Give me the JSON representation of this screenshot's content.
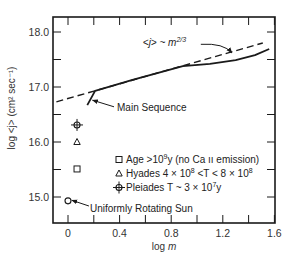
{
  "chart_data": {
    "type": "line",
    "title": "",
    "xlabel": "log m",
    "ylabel": "log <j> (cm² sec⁻¹)",
    "xlim": [
      -0.12,
      1.61
    ],
    "ylim": [
      14.53,
      18.27
    ],
    "grid": false,
    "x_ticks": [
      0,
      0.4,
      0.8,
      1.2,
      1.6
    ],
    "x_tick_labels": [
      "0",
      "0.4",
      "0.8",
      "1.2",
      "1.6"
    ],
    "x_minor_ticks": [
      0.2,
      0.6,
      1.0,
      1.4
    ],
    "y_ticks": [
      15.0,
      16.0,
      17.0,
      18.0
    ],
    "y_tick_labels": [
      "15.0",
      "16.0",
      "17.0",
      "18.0"
    ],
    "y_minor_ticks": [
      15.5,
      16.5,
      17.5
    ],
    "series": [
      {
        "name": "<j> ~ m^2/3",
        "style": "dashed",
        "x": [
          -0.09,
          1.51
        ],
        "y": [
          16.73,
          17.8
        ]
      },
      {
        "name": "Main Sequence",
        "style": "solid",
        "x": [
          0.15,
          0.21,
          0.5,
          0.89,
          1.1,
          1.3,
          1.45,
          1.56
        ],
        "y": [
          16.67,
          16.93,
          17.13,
          17.38,
          17.42,
          17.49,
          17.58,
          17.69
        ]
      }
    ],
    "points": [
      {
        "name": "Pleiades T ~ 3 x 10^7 y",
        "marker": "diamond-cross",
        "x": 0.07,
        "y": 16.31
      },
      {
        "name": "Hyades 4 x 10^8 < T < 8 x 10^8",
        "marker": "triangle",
        "x": 0.07,
        "y": 16.0
      },
      {
        "name": "Age > 10^9 y (no Ca II emission)",
        "marker": "square",
        "x": 0.07,
        "y": 15.51
      },
      {
        "name": "Uniformly Rotating Sun",
        "marker": "circle",
        "x": 0.0,
        "y": 14.93
      }
    ],
    "annotations": [
      {
        "text": "<j> ~ m",
        "sup": "2/3",
        "label_at": [
          0.58,
          17.74
        ],
        "arrow_to": [
          1.27,
          17.62
        ]
      },
      {
        "text": "Main Sequence",
        "label_at": [
          0.38,
          16.64
        ],
        "arrow_to": [
          0.19,
          16.76
        ]
      },
      {
        "text": "Uniformly Rotating Sun",
        "label_at": [
          0.17,
          14.8
        ],
        "arrow_to": [
          0.03,
          14.94
        ]
      }
    ],
    "legend": {
      "position": "lower-right-inside",
      "entries": [
        {
          "marker": "square",
          "text": "Age >10",
          "sup": "9",
          "tail": "y (no Ca ıı emission)"
        },
        {
          "marker": "triangle",
          "text": "Hyades 4 × 10",
          "sup": "8",
          "tail": " <T < 8 × 10",
          "sup2": "8"
        },
        {
          "marker": "diamond-cross",
          "text": "Pleiades T ~ 3 × 10",
          "sup": "7",
          "tail": "y"
        }
      ]
    }
  },
  "layout": {
    "plot_px": {
      "left": 53,
      "top": 17,
      "right": 275,
      "bottom": 223
    },
    "x_map": {
      "origin_px": 68,
      "px_per_unit": 129
    },
    "y_map": {
      "ref_value": 17,
      "ref_px": 87,
      "px_per_unit": 55
    },
    "ink_color": "#1a1a1a"
  }
}
